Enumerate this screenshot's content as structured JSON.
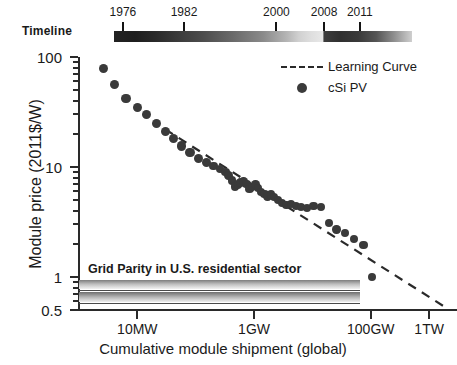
{
  "timeline": {
    "label": "Timeline",
    "years": [
      {
        "year": "1976",
        "pos": 0.03
      },
      {
        "year": "1982",
        "pos": 0.235
      },
      {
        "year": "2000",
        "pos": 0.545
      },
      {
        "year": "2008",
        "pos": 0.705
      },
      {
        "year": "2011",
        "pos": 0.825
      }
    ]
  },
  "legend": {
    "items": [
      {
        "label": "Learning Curve",
        "marker": "dashed-line",
        "color": "#2a2a2a"
      },
      {
        "label": "cSi PV",
        "marker": "filled-circle",
        "color": "#3b3b3b"
      }
    ]
  },
  "annotation": {
    "grid_parity": "Grid Parity in U.S. residential sector"
  },
  "chart_data": {
    "type": "scatter",
    "title": "",
    "xlabel": "Cumulative module shipment (global)",
    "ylabel": "Module price (2011$/W)",
    "xscale": "log",
    "yscale": "log",
    "xlim": [
      1000000,
      3000000000000
    ],
    "ylim": [
      0.5,
      100
    ],
    "grid": false,
    "legend_position": "top-right",
    "xticks": [
      {
        "label": "10MW",
        "value": 10000000
      },
      {
        "label": "1GW",
        "value": 1000000000
      },
      {
        "label": "100GW",
        "value": 100000000000
      },
      {
        "label": "1TW",
        "value": 1000000000000
      }
    ],
    "yticks": [
      {
        "label": "100",
        "value": 100
      },
      {
        "label": "10",
        "value": 10
      },
      {
        "label": "1",
        "value": 1
      },
      {
        "label": "0.5",
        "value": 0.5
      }
    ],
    "series": [
      {
        "name": "cSi PV",
        "type": "scatter",
        "color": "#3a3a3a",
        "marker": "filled-circle",
        "x": [
          2600000.0,
          4000000.0,
          6400000.0,
          10000000.0,
          14500000.0,
          21000000.0,
          30000000.0,
          42000000.0,
          57000000.0,
          80000000.0,
          110000000.0,
          155000000.0,
          200000000.0,
          260000000.0,
          320000000.0,
          370000000.0,
          420000000.0,
          470000000.0,
          530000000.0,
          590000000.0,
          660000000.0,
          740000000.0,
          830000000.0,
          930000000.0,
          1050000000.0,
          1180000000.0,
          1320000000.0,
          1500000000.0,
          1700000000.0,
          1950000000.0,
          2200000000.0,
          2600000000.0,
          3000000000.0,
          3600000000.0,
          4300000000.0,
          5200000000.0,
          6400000000.0,
          8000000000.0,
          10500000000.0,
          14000000000.0,
          19000000000.0,
          26000000000.0,
          36000000000.0,
          52000000000.0,
          75000000000.0,
          105000000000.0
        ],
        "y": [
          78,
          56,
          42,
          35,
          30,
          25,
          21,
          18,
          15.5,
          13.5,
          12,
          11,
          10.2,
          9.6,
          9.0,
          8.3,
          7.5,
          6.6,
          6.9,
          7.2,
          7.4,
          7.0,
          6.3,
          6.6,
          6.9,
          6.4,
          5.9,
          5.7,
          5.4,
          5.6,
          5.3,
          5.0,
          4.7,
          4.5,
          4.6,
          4.4,
          4.3,
          4.25,
          4.4,
          4.3,
          3.1,
          2.7,
          2.5,
          2.2,
          1.95,
          1.0
        ]
      },
      {
        "name": "Learning Curve",
        "type": "line",
        "style": "dashed",
        "color": "#2a2a2a",
        "x": [
          30000000.0,
          2000000000000.0
        ],
        "y": [
          22.0,
          0.52
        ]
      }
    ]
  }
}
